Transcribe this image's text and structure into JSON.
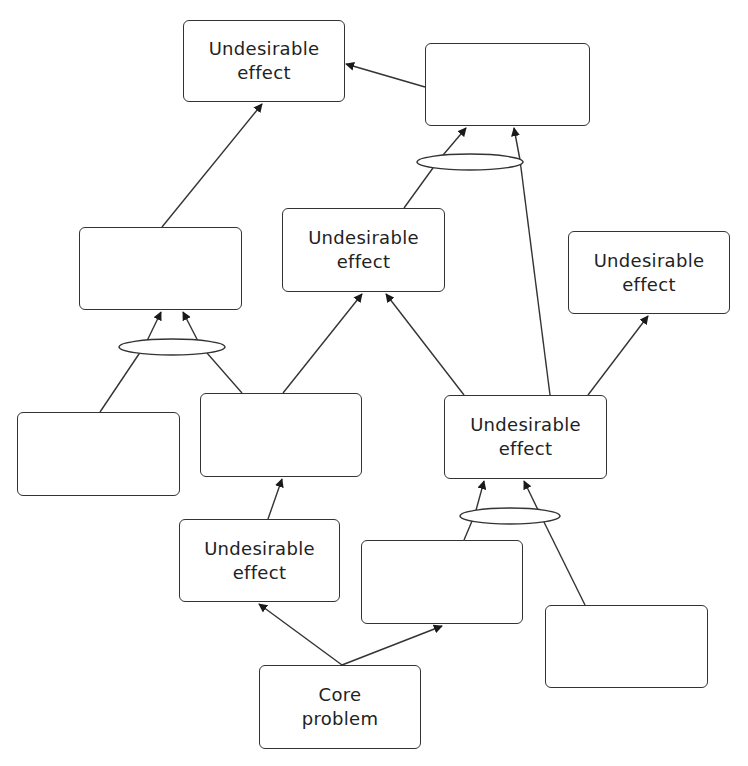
{
  "diagram": {
    "type": "current reality tree",
    "nodes": [
      {
        "id": "n1",
        "line1": "Undesirable",
        "line2": "effect",
        "x": 183,
        "y": 20,
        "w": 162,
        "h": 82
      },
      {
        "id": "n2",
        "line1": "",
        "line2": "",
        "x": 425,
        "y": 43,
        "w": 165,
        "h": 83
      },
      {
        "id": "n3",
        "line1": "",
        "line2": "",
        "x": 79,
        "y": 227,
        "w": 163,
        "h": 83
      },
      {
        "id": "n4",
        "line1": "Undesirable",
        "line2": "effect",
        "x": 282,
        "y": 208,
        "w": 163,
        "h": 84
      },
      {
        "id": "n5",
        "line1": "Undesirable",
        "line2": "effect",
        "x": 568,
        "y": 231,
        "w": 162,
        "h": 83
      },
      {
        "id": "n6",
        "line1": "",
        "line2": "",
        "x": 17,
        "y": 412,
        "w": 163,
        "h": 84
      },
      {
        "id": "n7",
        "line1": "",
        "line2": "",
        "x": 200,
        "y": 393,
        "w": 162,
        "h": 84
      },
      {
        "id": "n8",
        "line1": "Undesirable",
        "line2": "effect",
        "x": 444,
        "y": 395,
        "w": 163,
        "h": 84
      },
      {
        "id": "n9",
        "line1": "Undesirable",
        "line2": "effect",
        "x": 179,
        "y": 519,
        "w": 161,
        "h": 83
      },
      {
        "id": "n10",
        "line1": "",
        "line2": "",
        "x": 361,
        "y": 540,
        "w": 162,
        "h": 84
      },
      {
        "id": "n11",
        "line1": "",
        "line2": "",
        "x": 545,
        "y": 605,
        "w": 163,
        "h": 83
      },
      {
        "id": "n12",
        "line1": "Core",
        "line2": "problem",
        "x": 259,
        "y": 665,
        "w": 162,
        "h": 84
      }
    ],
    "and_connectors": [
      {
        "id": "and1",
        "cx": 470,
        "cy": 162,
        "rx": 53,
        "ry": 8,
        "target": "n2",
        "sources": [
          "n4",
          "n8"
        ]
      },
      {
        "id": "and2",
        "cx": 172,
        "cy": 347,
        "rx": 53,
        "ry": 8,
        "target": "n3",
        "sources": [
          "n6",
          "n7"
        ]
      },
      {
        "id": "and3",
        "cx": 510,
        "cy": 516,
        "rx": 50,
        "ry": 8,
        "target": "n8",
        "sources": [
          "n10",
          "n11"
        ]
      }
    ],
    "edges": [
      {
        "from": "n2",
        "to": "n1"
      },
      {
        "from": "n3",
        "to": "n1"
      },
      {
        "from": "n7",
        "to": "n4"
      },
      {
        "from": "n8",
        "to": "n4"
      },
      {
        "from": "n8",
        "to": "n5"
      },
      {
        "from": "n9",
        "to": "n7"
      },
      {
        "from": "n12",
        "to": "n9"
      },
      {
        "from": "n12",
        "to": "n10"
      }
    ],
    "colors": {
      "stroke": "#333333",
      "text": "#222222",
      "background": "#ffffff"
    }
  }
}
